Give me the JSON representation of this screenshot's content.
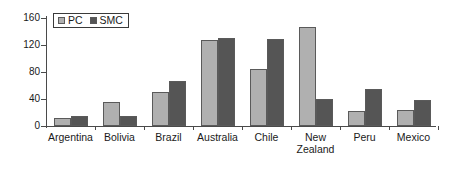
{
  "chart_data": {
    "type": "bar",
    "title": "",
    "subtitle": "",
    "xlabel": "",
    "ylabel": "",
    "ylim": [
      0,
      160
    ],
    "ytick_values": [
      0,
      40,
      80,
      120,
      160
    ],
    "ytick_labels": [
      "0",
      "40",
      "80",
      "120",
      "160"
    ],
    "grid": false,
    "legend_position": "top-left",
    "categories": [
      "Argentina",
      "Bolivia",
      "Brazil",
      "Australia",
      "Chile",
      "New\nZealand",
      "Peru",
      "Mexico"
    ],
    "series": [
      {
        "name": "PC",
        "color": "#b0b0b0",
        "values": [
          12,
          36,
          51,
          128,
          85,
          147,
          22,
          23
        ]
      },
      {
        "name": "SMC",
        "color": "#555555",
        "values": [
          15,
          15,
          67,
          130,
          129,
          40,
          55,
          39
        ]
      }
    ]
  },
  "legend": {
    "entries": [
      {
        "label": "PC"
      },
      {
        "label": "SMC"
      }
    ]
  },
  "colors": {
    "pc": "#b0b0b0",
    "smc": "#555555",
    "axis": "#4a4a4a",
    "text": "#1a1a1a",
    "background": "#ffffff"
  }
}
